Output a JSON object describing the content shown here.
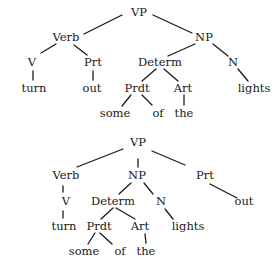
{
  "trees": [
    {
      "id": "tree-1",
      "nodes": [
        {
          "id": "vp",
          "label": "VP",
          "x": 139,
          "y": 13
        },
        {
          "id": "verb",
          "label": "Verb",
          "x": 66,
          "y": 38
        },
        {
          "id": "np",
          "label": "NP",
          "x": 204,
          "y": 38
        },
        {
          "id": "v",
          "label": "V",
          "x": 32,
          "y": 63
        },
        {
          "id": "prt",
          "label": "Prt",
          "x": 93,
          "y": 63
        },
        {
          "id": "determ",
          "label": "Determ",
          "x": 160,
          "y": 63
        },
        {
          "id": "n",
          "label": "N",
          "x": 233,
          "y": 63
        },
        {
          "id": "turn",
          "label": "turn",
          "x": 34,
          "y": 89
        },
        {
          "id": "out",
          "label": "out",
          "x": 92,
          "y": 89
        },
        {
          "id": "prdt",
          "label": "Prdt",
          "x": 137,
          "y": 89
        },
        {
          "id": "art",
          "label": "Art",
          "x": 183,
          "y": 89
        },
        {
          "id": "lights",
          "label": "lights",
          "x": 254,
          "y": 89
        },
        {
          "id": "some",
          "label": "some",
          "x": 115,
          "y": 114
        },
        {
          "id": "of",
          "label": "of",
          "x": 158,
          "y": 114
        },
        {
          "id": "the",
          "label": "the",
          "x": 184,
          "y": 114
        }
      ],
      "edges": [
        {
          "x1": 122,
          "y1": 15,
          "x2": 84,
          "y2": 34
        },
        {
          "x1": 153,
          "y1": 15,
          "x2": 192,
          "y2": 33
        },
        {
          "x1": 56,
          "y1": 44,
          "x2": 41,
          "y2": 53
        },
        {
          "x1": 74,
          "y1": 45,
          "x2": 87,
          "y2": 55
        },
        {
          "x1": 195,
          "y1": 44,
          "x2": 168,
          "y2": 56
        },
        {
          "x1": 213,
          "y1": 44,
          "x2": 228,
          "y2": 56
        },
        {
          "x1": 33,
          "y1": 71,
          "x2": 33,
          "y2": 80
        },
        {
          "x1": 93,
          "y1": 71,
          "x2": 93,
          "y2": 80
        },
        {
          "x1": 156,
          "y1": 69,
          "x2": 142,
          "y2": 81
        },
        {
          "x1": 164,
          "y1": 69,
          "x2": 178,
          "y2": 81
        },
        {
          "x1": 238,
          "y1": 69,
          "x2": 248,
          "y2": 81
        },
        {
          "x1": 131,
          "y1": 95,
          "x2": 122,
          "y2": 106
        },
        {
          "x1": 142,
          "y1": 95,
          "x2": 152,
          "y2": 105
        },
        {
          "x1": 184,
          "y1": 95,
          "x2": 184,
          "y2": 105
        }
      ]
    },
    {
      "id": "tree-2",
      "nodes": [
        {
          "id": "vp",
          "label": "VP",
          "x": 138,
          "y": 143
        },
        {
          "id": "verb",
          "label": "Verb",
          "x": 66,
          "y": 176
        },
        {
          "id": "np",
          "label": "NP",
          "x": 137,
          "y": 176
        },
        {
          "id": "prt",
          "label": "Prt",
          "x": 205,
          "y": 176
        },
        {
          "id": "v",
          "label": "V",
          "x": 66,
          "y": 202
        },
        {
          "id": "determ",
          "label": "Determ",
          "x": 113,
          "y": 202
        },
        {
          "id": "n",
          "label": "N",
          "x": 161,
          "y": 202
        },
        {
          "id": "out",
          "label": "out",
          "x": 244,
          "y": 202
        },
        {
          "id": "turn",
          "label": "turn",
          "x": 64,
          "y": 227
        },
        {
          "id": "prdt",
          "label": "Prdt",
          "x": 99,
          "y": 227
        },
        {
          "id": "art",
          "label": "Art",
          "x": 140,
          "y": 227
        },
        {
          "id": "lights",
          "label": "lights",
          "x": 188,
          "y": 227
        },
        {
          "id": "some",
          "label": "some",
          "x": 84,
          "y": 252
        },
        {
          "id": "of",
          "label": "of",
          "x": 120,
          "y": 252
        },
        {
          "id": "the",
          "label": "the",
          "x": 146,
          "y": 252
        }
      ],
      "edges": [
        {
          "x1": 123,
          "y1": 149,
          "x2": 77,
          "y2": 167
        },
        {
          "x1": 138,
          "y1": 159,
          "x2": 138,
          "y2": 167
        },
        {
          "x1": 152,
          "y1": 151,
          "x2": 185,
          "y2": 165
        },
        {
          "x1": 63,
          "y1": 186,
          "x2": 63,
          "y2": 192
        },
        {
          "x1": 131,
          "y1": 183,
          "x2": 119,
          "y2": 194
        },
        {
          "x1": 144,
          "y1": 183,
          "x2": 153,
          "y2": 194
        },
        {
          "x1": 210,
          "y1": 184,
          "x2": 237,
          "y2": 198
        },
        {
          "x1": 63,
          "y1": 211,
          "x2": 63,
          "y2": 218
        },
        {
          "x1": 113,
          "y1": 208,
          "x2": 101,
          "y2": 219
        },
        {
          "x1": 116,
          "y1": 208,
          "x2": 135,
          "y2": 219
        },
        {
          "x1": 165,
          "y1": 209,
          "x2": 173,
          "y2": 219
        },
        {
          "x1": 95,
          "y1": 233,
          "x2": 88,
          "y2": 244
        },
        {
          "x1": 100,
          "y1": 233,
          "x2": 112,
          "y2": 244
        },
        {
          "x1": 145,
          "y1": 234,
          "x2": 146,
          "y2": 243
        }
      ]
    }
  ]
}
